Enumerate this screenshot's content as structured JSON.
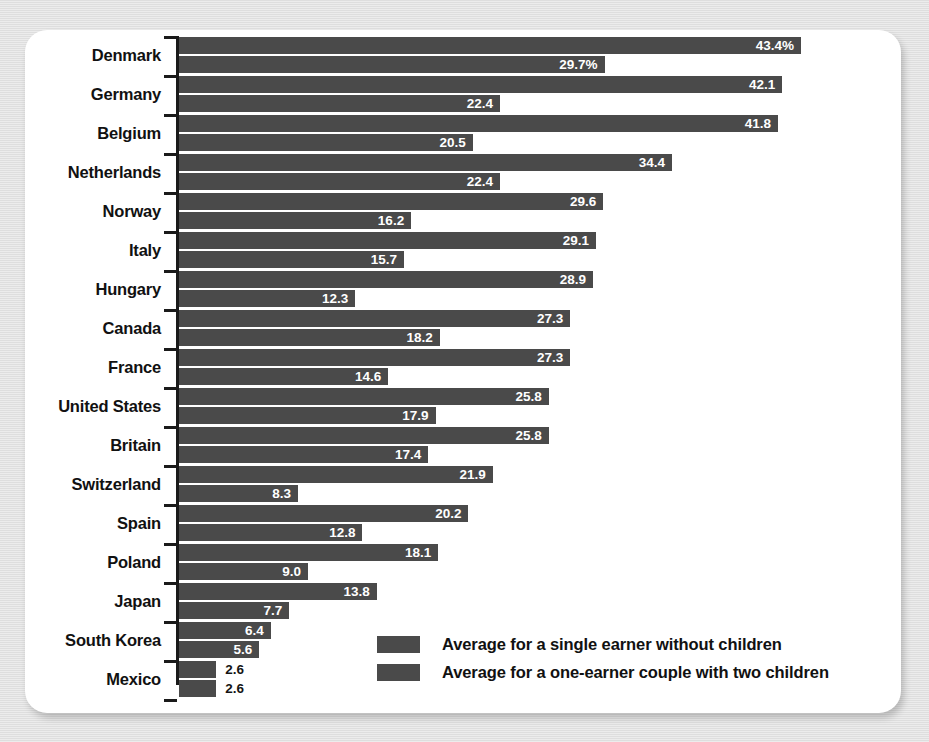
{
  "chart_data": {
    "type": "bar",
    "orientation": "horizontal",
    "title": "",
    "subtitle": "",
    "xlabel": "",
    "ylabel": "",
    "grid": false,
    "legend_position": "bottom-right",
    "axis_unit": "%",
    "xlim": [
      0,
      43.4
    ],
    "categories": [
      "Denmark",
      "Germany",
      "Belgium",
      "Netherlands",
      "Norway",
      "Italy",
      "Hungary",
      "Canada",
      "France",
      "United States",
      "Britain",
      "Switzerland",
      "Spain",
      "Poland",
      "Japan",
      "South Korea",
      "Mexico"
    ],
    "series": [
      {
        "name": "Average for a single earner without children",
        "values": [
          43.4,
          42.1,
          41.8,
          34.4,
          29.6,
          29.1,
          28.9,
          27.3,
          27.3,
          25.8,
          25.8,
          21.9,
          20.2,
          18.1,
          13.8,
          6.4,
          2.6
        ],
        "labels": [
          "43.4%",
          "42.1",
          "41.8",
          "34.4",
          "29.6",
          "29.1",
          "28.9",
          "27.3",
          "27.3",
          "25.8",
          "25.8",
          "21.9",
          "20.2",
          "18.1",
          "13.8",
          "6.4",
          "2.6"
        ]
      },
      {
        "name": "Average for a one-earner couple with two children",
        "values": [
          29.7,
          22.4,
          20.5,
          22.4,
          16.2,
          15.7,
          12.3,
          18.2,
          14.6,
          17.9,
          17.4,
          8.3,
          12.8,
          9.0,
          7.7,
          5.6,
          2.6
        ],
        "labels": [
          "29.7%",
          "22.4",
          "20.5",
          "22.4",
          "16.2",
          "15.7",
          "12.3",
          "18.2",
          "14.6",
          "17.9",
          "17.4",
          "8.3",
          "12.8",
          "9.0",
          "7.7",
          "5.6",
          "2.6"
        ]
      }
    ]
  },
  "legend": {
    "items": [
      {
        "label": "Average for a single earner without children",
        "color": "#4a4a4a"
      },
      {
        "label": "Average for a one-earner couple with two children",
        "color": "#4a4a4a"
      }
    ]
  },
  "colors": {
    "bar": "#4a4a4a",
    "card_background": "#ffffff",
    "page_background": "#e2e2e2",
    "axis": "#1a1a1a",
    "label_text": "#111111",
    "value_text_inside": "#ffffff",
    "value_text_outside": "#141414"
  }
}
